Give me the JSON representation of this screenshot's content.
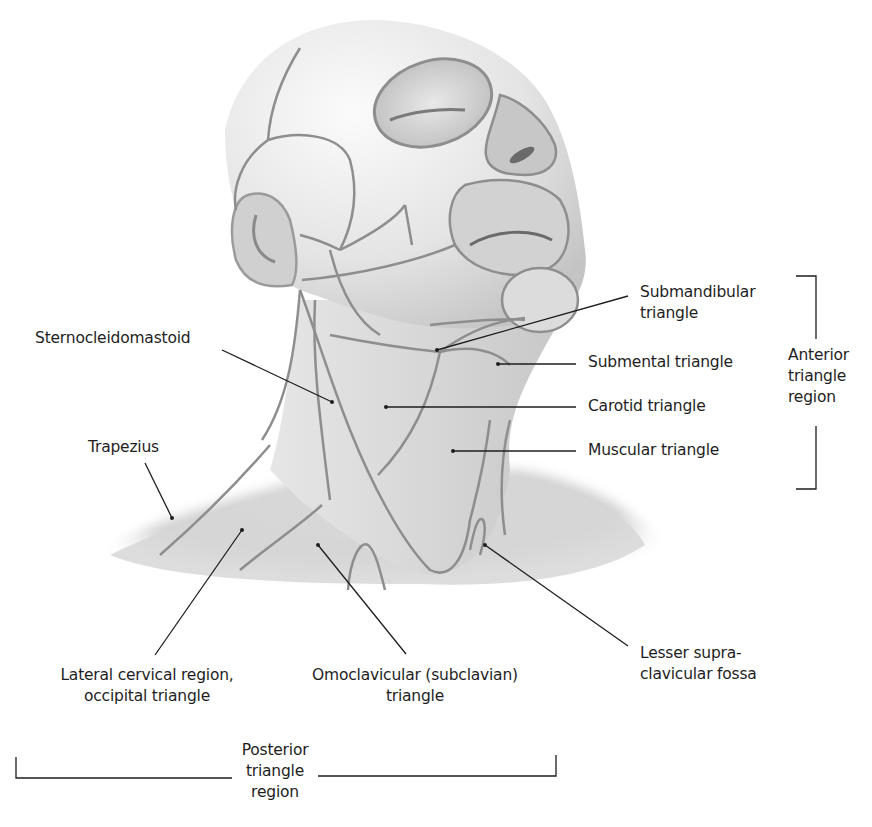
{
  "figure": {
    "colors": {
      "skin_light": "#f2f2f2",
      "skin_mid": "#cfcfcf",
      "skin_dark": "#9a9a9a",
      "region_line": "#8e8e8e",
      "leader_line": "#1e1e1e",
      "text": "#1e1e1e"
    }
  },
  "labels": {
    "submandibular": [
      "Submandibular",
      "triangle"
    ],
    "submental": "Submental triangle",
    "carotid": "Carotid triangle",
    "muscular": "Muscular triangle",
    "sternocleidomastoid": "Sternocleidomastoid",
    "trapezius": "Trapezius",
    "lateral_cervical": [
      "Lateral cervical region,",
      "occipital triangle"
    ],
    "omoclavicular": [
      "Omoclavicular (subclavian)",
      "triangle"
    ],
    "lesser_supraclavicular": [
      "Lesser supra-",
      "clavicular fossa"
    ]
  },
  "groups": {
    "anterior": [
      "Anterior",
      "triangle",
      "region"
    ],
    "posterior": [
      "Posterior",
      "triangle",
      "region"
    ]
  }
}
